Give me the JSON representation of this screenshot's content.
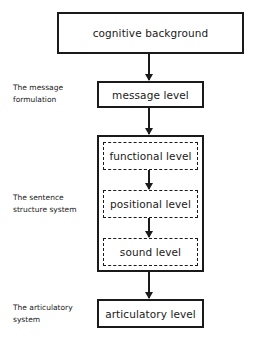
{
  "diagram": {
    "type": "flowchart",
    "direction": "top-to-bottom",
    "nodes": {
      "cognitive_background": "cognitive background",
      "message_level": "message level",
      "functional_level": "functional level",
      "positional_level": "positional level",
      "sound_level": "sound level",
      "articulatory_level": "articulatory level"
    },
    "groups": {
      "sentence_structure": [
        "functional level",
        "positional level",
        "sound level"
      ]
    },
    "labels": {
      "message_formulation": [
        "The message",
        "formulation"
      ],
      "sentence_structure": [
        "The sentence",
        "structure system"
      ],
      "articulatory_system": [
        "The articulatory",
        "system"
      ]
    },
    "edges": [
      [
        "cognitive background",
        "message level"
      ],
      [
        "message level",
        "sentence structure system"
      ],
      [
        "functional level",
        "positional level"
      ],
      [
        "positional level",
        "sound level"
      ],
      [
        "sentence structure system",
        "articulatory level"
      ]
    ],
    "colors": {
      "stroke": "#1a1a1a",
      "background": "#ffffff"
    }
  }
}
